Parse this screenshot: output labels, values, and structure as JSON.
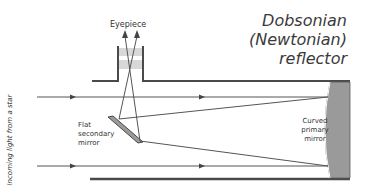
{
  "title": {
    "line1": "Dobsonian",
    "line2": "(Newtonian)",
    "line3": "reflector"
  },
  "labels": {
    "eyepiece": "Eyepiece",
    "secondary_line1": "Flat",
    "secondary_line2": "secondary",
    "secondary_line3": "mirror",
    "primary_line1": "Curved",
    "primary_line2": "primary",
    "primary_line3": "mirror",
    "incoming": "Incoming light from a star"
  },
  "colors": {
    "tube": "#4a4a4a",
    "ray": "#555555",
    "mirror_fill": "#9a9a9a",
    "lens": "#d8d8d8",
    "text": "#333333"
  }
}
